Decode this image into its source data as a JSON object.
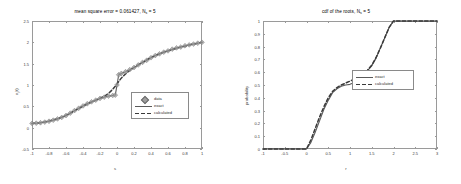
{
  "figure": {
    "background": "#ffffff",
    "axis_color": "#9a9a9a",
    "exact_color": "#5a5a5a",
    "calculated_color": "#3a3a3a",
    "data_marker_color": "#9e9e9e"
  },
  "left_panel": {
    "title_main": "mean square error = 0.061427, N",
    "title_sub": "s",
    "title_tail": " = 5",
    "xlabel": "s",
    "ylabel": "x",
    "ylabel_sub": "i",
    "ylabel_tail": "(t)",
    "xticks": [
      "-1",
      "-0.8",
      "-0.6",
      "-0.4",
      "-0.2",
      "0",
      "0.2",
      "0.4",
      "0.6",
      "0.8",
      "1"
    ],
    "xtick_values": [
      -1,
      -0.8,
      -0.6,
      -0.4,
      -0.2,
      0,
      0.2,
      0.4,
      0.6,
      0.8,
      1
    ],
    "yticks": [
      "-0.5",
      "0",
      "0.5",
      "1",
      "1.5",
      "2",
      "2.5"
    ],
    "ytick_values": [
      -0.5,
      0,
      0.5,
      1,
      1.5,
      2,
      2.5
    ],
    "legend": [
      {
        "label": "data",
        "key": "marker"
      },
      {
        "label": "exact",
        "key": "solid"
      },
      {
        "label": "calculated",
        "key": "dashed"
      }
    ]
  },
  "right_panel": {
    "title_main": "cdf of the roots, N",
    "title_sub": "s",
    "title_tail": " = 5",
    "xlabel": "r",
    "ylabel": "probability",
    "xticks": [
      "-1",
      "-0.5",
      "0",
      "0.5",
      "1",
      "1.5",
      "2",
      "2.5",
      "3"
    ],
    "xtick_values": [
      -1,
      -0.5,
      0,
      0.5,
      1,
      1.5,
      2,
      2.5,
      3
    ],
    "yticks": [
      "0",
      "0.1",
      "0.2",
      "0.3",
      "0.4",
      "0.5",
      "0.6",
      "0.7",
      "0.8",
      "0.9",
      "1"
    ],
    "ytick_values": [
      0,
      0.1,
      0.2,
      0.3,
      0.4,
      0.5,
      0.6,
      0.7,
      0.8,
      0.9,
      1
    ],
    "legend": [
      {
        "label": "exact",
        "key": "solid"
      },
      {
        "label": "calculated",
        "key": "dashed"
      }
    ]
  },
  "chart_data": [
    {
      "type": "line",
      "id": "left-regression",
      "title": "mean square error = 0.061427, N_s = 5",
      "xlabel": "s",
      "ylabel": "x_i(t)",
      "xlim": [
        -1,
        1
      ],
      "ylim": [
        -0.5,
        2.5
      ],
      "grid": false,
      "legend_position": "center-right",
      "annotations": [
        "mean square error = 0.061427",
        "N_s = 5"
      ],
      "x": [
        -1,
        -0.95,
        -0.9,
        -0.85,
        -0.8,
        -0.75,
        -0.7,
        -0.65,
        -0.6,
        -0.55,
        -0.5,
        -0.45,
        -0.4,
        -0.35,
        -0.3,
        -0.25,
        -0.2,
        -0.15,
        -0.1,
        -0.05,
        -0.02,
        0,
        0.02,
        0.05,
        0.1,
        0.15,
        0.2,
        0.25,
        0.3,
        0.35,
        0.4,
        0.45,
        0.5,
        0.55,
        0.6,
        0.65,
        0.7,
        0.75,
        0.8,
        0.85,
        0.9,
        0.95,
        1
      ],
      "series": [
        {
          "name": "exact",
          "style": "solid",
          "values": [
            0.1,
            0.105,
            0.115,
            0.13,
            0.15,
            0.175,
            0.205,
            0.24,
            0.285,
            0.34,
            0.4,
            0.455,
            0.51,
            0.56,
            0.605,
            0.645,
            0.685,
            0.715,
            0.74,
            0.755,
            0.762,
            1.0,
            1.24,
            1.27,
            1.31,
            1.36,
            1.41,
            1.47,
            1.53,
            1.58,
            1.64,
            1.69,
            1.73,
            1.77,
            1.8,
            1.84,
            1.87,
            1.89,
            1.92,
            1.94,
            1.96,
            1.98,
            2.0
          ]
        },
        {
          "name": "calculated",
          "style": "dashed",
          "values": [
            0.1,
            0.107,
            0.118,
            0.134,
            0.155,
            0.181,
            0.212,
            0.248,
            0.29,
            0.34,
            0.395,
            0.45,
            0.505,
            0.555,
            0.6,
            0.645,
            0.69,
            0.735,
            0.8,
            0.9,
            0.97,
            1.02,
            1.08,
            1.16,
            1.26,
            1.34,
            1.41,
            1.47,
            1.53,
            1.59,
            1.64,
            1.69,
            1.73,
            1.77,
            1.8,
            1.83,
            1.86,
            1.89,
            1.91,
            1.94,
            1.96,
            1.98,
            2.0
          ]
        },
        {
          "name": "data",
          "style": "markers",
          "values": [
            0.1,
            0.105,
            0.115,
            0.13,
            0.15,
            0.175,
            0.205,
            0.24,
            0.285,
            0.34,
            0.4,
            0.455,
            0.51,
            0.56,
            0.605,
            0.645,
            0.685,
            0.715,
            0.74,
            0.755,
            0.762,
            1.0,
            1.24,
            1.27,
            1.31,
            1.36,
            1.41,
            1.47,
            1.53,
            1.58,
            1.64,
            1.69,
            1.73,
            1.77,
            1.8,
            1.84,
            1.87,
            1.89,
            1.92,
            1.94,
            1.96,
            1.98,
            2.0
          ]
        }
      ]
    },
    {
      "type": "line",
      "id": "right-cdf",
      "title": "cdf of the roots, N_s = 5",
      "xlabel": "r",
      "ylabel": "probability",
      "xlim": [
        -1,
        3
      ],
      "ylim": [
        0,
        1
      ],
      "grid": false,
      "legend_position": "center-right",
      "x": [
        -1,
        -0.5,
        0,
        0.1,
        0.2,
        0.3,
        0.4,
        0.5,
        0.6,
        0.7,
        0.8,
        0.9,
        1.0,
        1.1,
        1.2,
        1.3,
        1.4,
        1.5,
        1.6,
        1.7,
        1.8,
        1.9,
        2.0,
        2.2,
        2.5,
        3.0
      ],
      "series": [
        {
          "name": "exact",
          "style": "solid",
          "values": [
            0.0,
            0.0,
            0.0,
            0.05,
            0.13,
            0.22,
            0.31,
            0.38,
            0.44,
            0.47,
            0.49,
            0.5,
            0.505,
            0.52,
            0.545,
            0.575,
            0.61,
            0.65,
            0.71,
            0.79,
            0.87,
            0.95,
            1.0,
            1.0,
            1.0,
            1.0
          ]
        },
        {
          "name": "calculated",
          "style": "dashed",
          "values": [
            0.0,
            0.0,
            0.0,
            0.07,
            0.16,
            0.25,
            0.33,
            0.4,
            0.45,
            0.48,
            0.5,
            0.515,
            0.53,
            0.545,
            0.56,
            0.585,
            0.615,
            0.655,
            0.715,
            0.79,
            0.87,
            0.95,
            1.0,
            1.0,
            1.0,
            1.0
          ]
        }
      ]
    }
  ]
}
